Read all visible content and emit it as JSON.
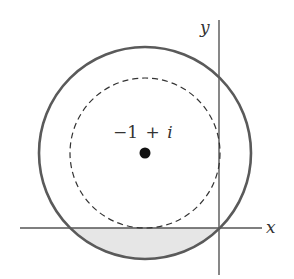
{
  "figure": {
    "center_label": "−1 + i",
    "center_label_parts": {
      "minus_one": "−1",
      "plus": "+",
      "i": "i"
    },
    "x_axis_label": "x",
    "y_axis_label": "y",
    "center_complex": {
      "re": -1,
      "im": 1
    },
    "inner_circle": {
      "style": "dashed",
      "radius": 1,
      "tangent_to": [
        "x-axis",
        "y-axis"
      ]
    },
    "outer_circle": {
      "style": "solid",
      "radius": 1.414,
      "passes_through": "origin"
    },
    "shaded_region": "part of outer disk below the x-axis",
    "colors": {
      "axis": "#555555",
      "outer_circle": "#555555",
      "inner_circle": "#333333",
      "shade": "#e6e6e6",
      "point": "#111111",
      "text": "#333333"
    }
  }
}
